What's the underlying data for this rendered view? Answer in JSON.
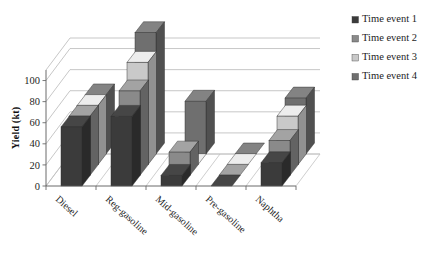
{
  "chart_data": {
    "type": "bar",
    "title": "",
    "subtitle": "",
    "xlabel": "",
    "ylabel": "Yield  (kt)",
    "categories": [
      "Diesel",
      "Reg-gasoline",
      "Mid-gasoline",
      "Pre-gasoline",
      "Naphtha"
    ],
    "series": [
      {
        "name": "Time event 1",
        "color": "#3b3b3b",
        "values": [
          56,
          66,
          10,
          0,
          22
        ]
      },
      {
        "name": "Time event 2",
        "color": "#8a8a8a",
        "values": [
          56,
          80,
          22,
          0,
          33
        ]
      },
      {
        "name": "Time event 3",
        "color": "#c9c9c9",
        "values": [
          56,
          97,
          0,
          0,
          46
        ]
      },
      {
        "name": "Time event 4",
        "color": "#6f6f6f",
        "values": [
          56,
          115,
          50,
          0,
          53
        ]
      }
    ],
    "ylim": [
      0,
      110
    ],
    "ytick_values": [
      0,
      20,
      40,
      60,
      80,
      100
    ],
    "ytick_labels": [
      "0",
      "20",
      "40",
      "60",
      "80",
      "100"
    ],
    "grid": true,
    "grid_style": "3d-wall-horizontal",
    "legend_position": "right",
    "projection": "3d-clustered-column",
    "depth_series_order": [
      "Time event 1",
      "Time event 2",
      "Time event 3",
      "Time event 4"
    ]
  },
  "legend": {
    "items": [
      {
        "label": "Time event 1",
        "marker": "square-swatch-icon",
        "color": "#3b3b3b"
      },
      {
        "label": "Time event 2",
        "marker": "square-swatch-icon",
        "color": "#8a8a8a"
      },
      {
        "label": "Time event 3",
        "marker": "square-swatch-icon",
        "color": "#c9c9c9"
      },
      {
        "label": "Time event 4",
        "marker": "square-swatch-icon",
        "color": "#6f6f6f"
      }
    ]
  },
  "axes": {
    "y_title": "Yield  (kt)",
    "y_ticks": [
      "0",
      "20",
      "40",
      "60",
      "80",
      "100"
    ],
    "x_categories": [
      "Diesel",
      "Reg-gasoline",
      "Mid-gasoline",
      "Pre-gasoline",
      "Naphtha"
    ]
  },
  "colors": {
    "series_1": "#3b3b3b",
    "series_2": "#8a8a8a",
    "series_3": "#c9c9c9",
    "series_4": "#6f6f6f",
    "grid": "#b9b9b9",
    "axis": "#5a5a5a",
    "background": "#ffffff",
    "text": "#1d1d1d"
  }
}
